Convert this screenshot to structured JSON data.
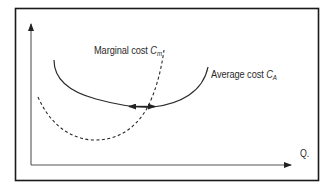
{
  "diagram": {
    "colors": {
      "frame": "#1a1a1a",
      "axis": "#555555",
      "curve": "#2a2a2a",
      "background": "#ffffff"
    },
    "axes": {
      "x_label": "Q.",
      "y_label": ""
    },
    "curves": {
      "marginal_cost": {
        "label_text": "Marginal cost ",
        "symbol": "C",
        "subscript": "m",
        "style": "dashed"
      },
      "average_cost": {
        "label_text": "Average cost ",
        "symbol": "C",
        "subscript": "A",
        "style": "solid"
      }
    },
    "annotation": {
      "type": "double-headed-arrow",
      "meaning": "minimum of average cost where marginal cost intersects"
    }
  }
}
